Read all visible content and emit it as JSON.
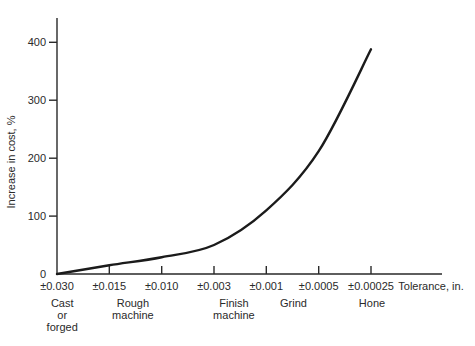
{
  "chart_data": {
    "type": "line",
    "title": "",
    "xlabel": "Tolerance, in.",
    "ylabel": "Increase in cost, %",
    "x_tick_labels": [
      "±0.030",
      "±0.015",
      "±0.010",
      "±0.003",
      "±0.001",
      "±0.0005",
      "±0.00025"
    ],
    "y_ticks": [
      0,
      100,
      200,
      300,
      400
    ],
    "ylim": [
      0,
      442
    ],
    "grid": false,
    "legend": "none",
    "series": [
      {
        "name": "increase-in-cost",
        "x_index": [
          0,
          1,
          2,
          3,
          4,
          5,
          6
        ],
        "values": [
          0,
          15,
          29,
          50,
          110,
          212,
          388
        ]
      }
    ],
    "process_labels": [
      {
        "lines": [
          "Cast",
          "or",
          "forged"
        ],
        "at_index": 0.1
      },
      {
        "lines": [
          "Rough",
          "machine"
        ],
        "at_index": 1.45
      },
      {
        "lines": [
          "Finish",
          "machine"
        ],
        "at_index": 3.38
      },
      {
        "lines": [
          "Grind"
        ],
        "at_index": 4.52
      },
      {
        "lines": [
          "Hone"
        ],
        "at_index": 6.02
      }
    ],
    "colors": {
      "ink": "#2a2a2a",
      "curve": "#1b1b1b",
      "background": "#ffffff"
    }
  }
}
